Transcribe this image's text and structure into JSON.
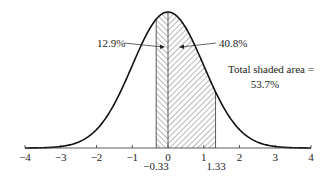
{
  "chart_data": {
    "type": "area",
    "title": "",
    "xlabel": "",
    "ylabel": "",
    "xlim": [
      -4,
      4
    ],
    "x_ticks": [
      -4,
      -3,
      -2,
      -1,
      0,
      1,
      2,
      3,
      4
    ],
    "x_tick_labels": [
      "−4",
      "−3",
      "−2",
      "−1",
      "0",
      "1",
      "2",
      "3",
      "4"
    ],
    "grid": false,
    "curve": {
      "distribution": "normal",
      "mean": 0,
      "sd": 1
    },
    "shaded_regions": [
      {
        "from": -0.33,
        "to": 0,
        "area_pct": 12.9,
        "hatch": "backslash"
      },
      {
        "from": 0,
        "to": 1.33,
        "area_pct": 40.8,
        "hatch": "slash"
      }
    ],
    "boundary_labels": [
      "−0.33",
      "1.33"
    ],
    "annotations": {
      "left_area": "12.9%",
      "right_area": "40.8%",
      "total_line1": "Total shaded area =",
      "total_line2": "53.7%"
    },
    "total_shaded_pct": 53.7
  }
}
